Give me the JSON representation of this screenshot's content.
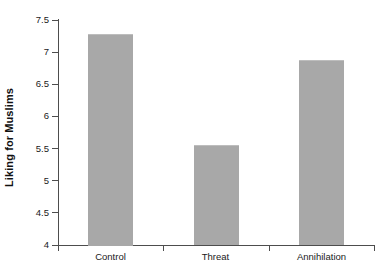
{
  "chart_data": {
    "type": "bar",
    "title": "",
    "subtitle": "",
    "xlabel": "",
    "ylabel": "Liking for Muslims",
    "categories": [
      "Control",
      "Threat",
      "Annihilation"
    ],
    "values": [
      7.29,
      5.56,
      6.88
    ],
    "series": [
      {
        "name": "Liking for Muslims",
        "values": [
          7.29,
          5.56,
          6.88
        ]
      }
    ],
    "ylim": [
      4,
      7.5
    ],
    "yticks": [
      4,
      4.5,
      5,
      5.5,
      6,
      6.5,
      7,
      7.5
    ],
    "ytick_labels": [
      "4",
      "4.5",
      "5",
      "5.5",
      "6",
      "6.5",
      "7",
      "7.5"
    ],
    "grid": false,
    "legend": false,
    "legend_position": "none",
    "bar_color": "#a8a8a8",
    "axis_color": "#4d4d4d",
    "text_color": "#1a1a1a",
    "background": "#ffffff"
  }
}
